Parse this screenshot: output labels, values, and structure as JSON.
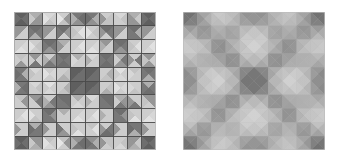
{
  "figure": {
    "background_color": "#ffffff",
    "width": 340,
    "height": 159,
    "panel_count": 2
  },
  "panels": [
    {
      "id": "flat",
      "name": "flat-shaded-wireframe-panel",
      "caption": "",
      "x": 14,
      "y": 12,
      "width": 142,
      "height": 138,
      "grid_rows": 10,
      "grid_cols": 10,
      "wireframe_visible": true,
      "wireframe_color": "#4a4a4a",
      "wireframe_width": 0.9,
      "shading": "flat",
      "border_color": "#bdbdbd"
    },
    {
      "id": "smooth",
      "name": "smooth-shaded-surface-panel",
      "caption": "",
      "x": 183,
      "y": 12,
      "width": 142,
      "height": 138,
      "grid_rows": 10,
      "grid_cols": 10,
      "wireframe_visible": false,
      "wireframe_color": "none",
      "wireframe_width": 0,
      "shading": "smooth",
      "border_color": "#bdbdbd"
    }
  ],
  "palette": {
    "darkest": "#5e5e5e",
    "dark": "#6f6f6f",
    "mid_dark": "#878787",
    "mid": "#9e9e9e",
    "mid_light": "#b4b4b4",
    "light": "#c9c9c9",
    "lighter": "#dcdcdc",
    "lightest": "#ededed",
    "white": "#f7f7f7"
  },
  "chart_data": {
    "type": "heatmap",
    "xlabel": "",
    "ylabel": "",
    "grid": true,
    "legend": "none",
    "rows": 10,
    "cols": 10,
    "note": "Each cell of the 10x10 lattice is split by both diagonals into four triangles (north, east, south, west). Values below are per-triangle luminance in 0-255, read off the left panel.",
    "triangle_order": [
      "north",
      "east",
      "south",
      "west"
    ],
    "luminance": [
      [
        [
          95,
          110,
          95,
          110
        ],
        [
          175,
          150,
          150,
          200
        ],
        [
          215,
          205,
          195,
          225
        ],
        [
          205,
          150,
          195,
          230
        ],
        [
          120,
          110,
          145,
          175
        ],
        [
          120,
          175,
          145,
          110
        ],
        [
          205,
          195,
          195,
          150
        ],
        [
          215,
          195,
          205,
          205
        ],
        [
          175,
          200,
          150,
          150
        ],
        [
          95,
          110,
          95,
          110
        ]
      ],
      [
        [
          150,
          205,
          205,
          150
        ],
        [
          110,
          120,
          175,
          120
        ],
        [
          150,
          205,
          205,
          150
        ],
        [
          110,
          150,
          205,
          120
        ],
        [
          205,
          225,
          205,
          195
        ],
        [
          205,
          195,
          205,
          225
        ],
        [
          110,
          120,
          205,
          150
        ],
        [
          150,
          205,
          205,
          150
        ],
        [
          110,
          175,
          120,
          120
        ],
        [
          150,
          205,
          205,
          150
        ]
      ],
      [
        [
          205,
          215,
          225,
          205
        ],
        [
          205,
          195,
          205,
          225
        ],
        [
          110,
          120,
          150,
          120
        ],
        [
          175,
          205,
          205,
          150
        ],
        [
          205,
          225,
          215,
          205
        ],
        [
          205,
          215,
          225,
          205
        ],
        [
          150,
          205,
          205,
          175
        ],
        [
          110,
          120,
          150,
          120
        ],
        [
          205,
          225,
          205,
          195
        ],
        [
          205,
          225,
          215,
          205
        ]
      ],
      [
        [
          195,
          205,
          150,
          205
        ],
        [
          150,
          205,
          120,
          205
        ],
        [
          205,
          150,
          120,
          175
        ],
        [
          110,
          120,
          110,
          120
        ],
        [
          175,
          205,
          205,
          215
        ],
        [
          215,
          205,
          205,
          175
        ],
        [
          110,
          120,
          110,
          120
        ],
        [
          175,
          120,
          150,
          205
        ],
        [
          205,
          120,
          205,
          150
        ],
        [
          150,
          205,
          150,
          195
        ]
      ],
      [
        [
          120,
          175,
          120,
          110
        ],
        [
          215,
          205,
          205,
          195
        ],
        [
          205,
          215,
          205,
          225
        ],
        [
          205,
          195,
          175,
          205
        ],
        [
          95,
          110,
          110,
          95
        ],
        [
          95,
          110,
          110,
          95
        ],
        [
          205,
          175,
          195,
          205
        ],
        [
          225,
          205,
          215,
          205
        ],
        [
          195,
          205,
          205,
          215
        ],
        [
          110,
          120,
          175,
          120
        ]
      ],
      [
        [
          120,
          110,
          120,
          175
        ],
        [
          215,
          195,
          205,
          205
        ],
        [
          225,
          205,
          215,
          205
        ],
        [
          205,
          175,
          195,
          205
        ],
        [
          95,
          110,
          110,
          95
        ],
        [
          95,
          110,
          110,
          95
        ],
        [
          205,
          195,
          175,
          205
        ],
        [
          205,
          215,
          205,
          225
        ],
        [
          205,
          205,
          195,
          215
        ],
        [
          175,
          120,
          110,
          120
        ]
      ],
      [
        [
          195,
          150,
          205,
          205
        ],
        [
          150,
          120,
          205,
          205
        ],
        [
          205,
          120,
          150,
          175
        ],
        [
          110,
          110,
          120,
          120
        ],
        [
          175,
          205,
          215,
          205
        ],
        [
          215,
          205,
          205,
          175
        ],
        [
          110,
          110,
          120,
          120
        ],
        [
          175,
          150,
          120,
          205
        ],
        [
          205,
          205,
          120,
          150
        ],
        [
          150,
          150,
          205,
          195
        ]
      ],
      [
        [
          205,
          225,
          215,
          205
        ],
        [
          205,
          205,
          195,
          225
        ],
        [
          110,
          150,
          120,
          120
        ],
        [
          175,
          205,
          205,
          205
        ],
        [
          205,
          215,
          225,
          205
        ],
        [
          205,
          225,
          215,
          205
        ],
        [
          205,
          205,
          205,
          175
        ],
        [
          110,
          150,
          120,
          120
        ],
        [
          205,
          205,
          225,
          195
        ],
        [
          205,
          215,
          225,
          205
        ]
      ],
      [
        [
          205,
          205,
          205,
          150
        ],
        [
          175,
          120,
          120,
          110
        ],
        [
          205,
          205,
          205,
          150
        ],
        [
          205,
          205,
          150,
          120
        ],
        [
          205,
          205,
          225,
          195
        ],
        [
          195,
          225,
          205,
          205
        ],
        [
          205,
          120,
          110,
          150
        ],
        [
          205,
          205,
          205,
          150
        ],
        [
          120,
          120,
          175,
          110
        ],
        [
          205,
          205,
          205,
          150
        ]
      ],
      [
        [
          95,
          110,
          95,
          110
        ],
        [
          150,
          150,
          175,
          200
        ],
        [
          195,
          205,
          215,
          225
        ],
        [
          195,
          150,
          205,
          230
        ],
        [
          145,
          110,
          120,
          175
        ],
        [
          145,
          175,
          120,
          110
        ],
        [
          195,
          195,
          205,
          150
        ],
        [
          205,
          195,
          215,
          205
        ],
        [
          150,
          200,
          175,
          150
        ],
        [
          95,
          110,
          95,
          110
        ]
      ]
    ]
  },
  "motifs": {
    "description": "Repeating octagonal star / diamond motif produced by the triangle shading; dark diamonds sit on a 4-cell pitch with light diagonal rays between them.",
    "dark_diamond_centers": [
      [
        1,
        1
      ],
      [
        1,
        3
      ],
      [
        1,
        6
      ],
      [
        1,
        8
      ],
      [
        3,
        1
      ],
      [
        3,
        3
      ],
      [
        3,
        6
      ],
      [
        3,
        8
      ],
      [
        6,
        1
      ],
      [
        6,
        3
      ],
      [
        6,
        6
      ],
      [
        6,
        8
      ],
      [
        8,
        1
      ],
      [
        8,
        3
      ],
      [
        8,
        6
      ],
      [
        8,
        8
      ]
    ],
    "center_star": [
      4.5,
      4.5
    ]
  }
}
